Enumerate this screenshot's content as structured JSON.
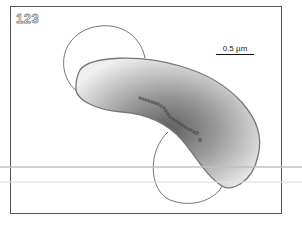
{
  "panel": {
    "label": "123"
  },
  "scale_bar": {
    "label": "0.5 µm"
  },
  "colors": {
    "frame": "#555555",
    "outline": "#777777",
    "cell_dark": "#6a6a6a",
    "cell_light": "#f2f2f2",
    "beads": "#444444"
  }
}
